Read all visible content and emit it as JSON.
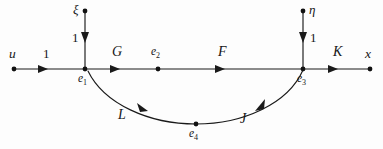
{
  "diagram": {
    "background_color": "#fdfdfd",
    "line_color": "#1a1a1a",
    "nodes": [
      {
        "id": "u",
        "label": "u",
        "x": 14,
        "y": 69,
        "label_x": 9,
        "label_y": 47
      },
      {
        "id": "e1",
        "label": "e",
        "sub": "1",
        "x": 85,
        "y": 69,
        "label_x": 78,
        "label_y": 73
      },
      {
        "id": "e2",
        "label": "e",
        "sub": "2",
        "x": 158,
        "y": 69,
        "label_x": 151,
        "label_y": 46
      },
      {
        "id": "e3",
        "label": "e",
        "sub": "3",
        "x": 303,
        "y": 69,
        "label_x": 297,
        "label_y": 73
      },
      {
        "id": "e4",
        "label": "e",
        "sub": "4",
        "x": 196,
        "y": 124,
        "label_x": 189,
        "label_y": 128
      },
      {
        "id": "x",
        "label": "x",
        "x": 370,
        "y": 69,
        "label_x": 365,
        "label_y": 47
      },
      {
        "id": "xi",
        "label": "ξ",
        "x": 85,
        "y": 11,
        "label_x": 73,
        "label_y": 3
      },
      {
        "id": "eta",
        "label": "η",
        "x": 303,
        "y": 11,
        "label_x": 309,
        "label_y": 3
      }
    ],
    "edges": [
      {
        "id": "u-e1",
        "label": "1",
        "from": "u",
        "to": "e1",
        "label_x": 43,
        "label_y": 47,
        "orientation": "horizontal"
      },
      {
        "id": "e1-e2",
        "label": "G",
        "from": "e1",
        "to": "e2",
        "label_x": 112,
        "label_y": 45,
        "orientation": "horizontal"
      },
      {
        "id": "e2-e3",
        "label": "F",
        "from": "e2",
        "to": "e3",
        "label_x": 218,
        "label_y": 45,
        "orientation": "horizontal"
      },
      {
        "id": "e3-x",
        "label": "K",
        "from": "e3",
        "to": "x",
        "label_x": 333,
        "label_y": 45,
        "orientation": "horizontal"
      },
      {
        "id": "xi-e1",
        "label": "1",
        "from": "xi",
        "to": "e1",
        "label_x": 72,
        "label_y": 31,
        "orientation": "vertical"
      },
      {
        "id": "eta-e3",
        "label": "1",
        "from": "eta",
        "to": "e3",
        "label_x": 310,
        "label_y": 31,
        "orientation": "vertical"
      },
      {
        "id": "e3-e4",
        "label": "J",
        "from": "e3",
        "to": "e4",
        "label_x": 240,
        "label_y": 112,
        "orientation": "curve"
      },
      {
        "id": "e4-e1",
        "label": "L",
        "from": "e4",
        "to": "e1",
        "label_x": 118,
        "label_y": 108,
        "orientation": "curve"
      }
    ],
    "arrows": [
      {
        "id": "arrow-u-e1",
        "x": 45,
        "y": 69,
        "direction": "right"
      },
      {
        "id": "arrow-e1-e2",
        "x": 117,
        "y": 69,
        "direction": "right"
      },
      {
        "id": "arrow-e2-e3",
        "x": 222,
        "y": 69,
        "direction": "right"
      },
      {
        "id": "arrow-e3-x",
        "x": 335,
        "y": 69,
        "direction": "right"
      },
      {
        "id": "arrow-xi-e1",
        "x": 85,
        "y": 40,
        "direction": "down"
      },
      {
        "id": "arrow-eta-e3",
        "x": 303,
        "y": 40,
        "direction": "down"
      },
      {
        "id": "arrow-j",
        "x": 258,
        "y": 108,
        "direction": "down-left"
      },
      {
        "id": "arrow-l",
        "x": 143,
        "y": 107,
        "direction": "up-left"
      }
    ]
  }
}
